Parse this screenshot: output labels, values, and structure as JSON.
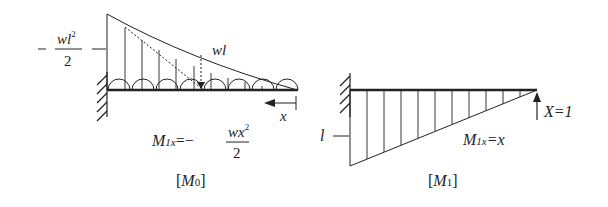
{
  "left_diagram": {
    "caption": "[M0]",
    "caption_main": "M",
    "caption_sub": "0",
    "moment_label_num": "wl",
    "moment_label_sup": "2",
    "moment_label_den": "2",
    "moment_label_sign": "−",
    "resultant_label": "wl",
    "x_label": "x",
    "equation_M": "M",
    "equation_sub": "1x",
    "equation_rhs_sign": "=−",
    "equation_num": "wx",
    "equation_num_sup": "2",
    "equation_den": "2"
  },
  "right_diagram": {
    "caption": "[M1]",
    "caption_main": "M",
    "caption_sub": "1",
    "length_label": "l",
    "force_label": "X=1",
    "equation_M": "M",
    "equation_sub": "1x",
    "equation_rhs": "=x"
  },
  "colors": {
    "line": "#222222",
    "background": "#ffffff"
  }
}
